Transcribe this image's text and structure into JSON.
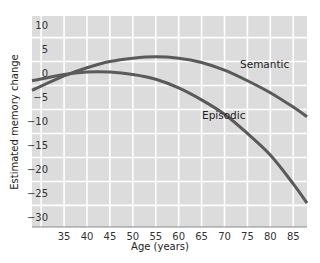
{
  "chart_data": {
    "type": "line",
    "title": "",
    "xlabel": "Age (years)",
    "ylabel": "Estimated memory change",
    "xlim": [
      28,
      88
    ],
    "ylim": [
      -32,
      12
    ],
    "x_ticks": [
      35,
      40,
      45,
      50,
      55,
      60,
      65,
      70,
      75,
      80,
      85
    ],
    "y_ticks": [
      10,
      5,
      0,
      -5,
      -10,
      -15,
      -20,
      -25,
      -30
    ],
    "grid": true,
    "legend_position": "inline labels",
    "series": [
      {
        "name": "Semantic",
        "x": [
          28,
          35,
          40,
          45,
          50,
          55,
          60,
          65,
          70,
          75,
          80,
          85,
          88
        ],
        "values": [
          -3.5,
          -0.5,
          1.2,
          2.5,
          3.2,
          3.5,
          3.2,
          2.3,
          0.7,
          -1.5,
          -4.0,
          -7.0,
          -9.0
        ]
      },
      {
        "name": "Episodic",
        "x": [
          28,
          35,
          40,
          45,
          50,
          55,
          60,
          65,
          70,
          75,
          80,
          85,
          88
        ],
        "values": [
          -1.5,
          -0.2,
          0.3,
          0.3,
          -0.2,
          -1.2,
          -3.0,
          -5.5,
          -8.5,
          -12.5,
          -17.0,
          -23.0,
          -27.0
        ]
      }
    ]
  }
}
